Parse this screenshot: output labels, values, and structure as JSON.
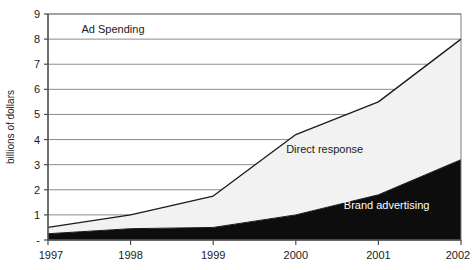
{
  "chart_data": {
    "type": "area",
    "title": "Ad Spending",
    "xlabel": "",
    "ylabel": "billions of dollars",
    "categories": [
      "1997",
      "1998",
      "1999",
      "2000",
      "2001",
      "2002"
    ],
    "x": [
      1997,
      1998,
      1999,
      2000,
      2001,
      2002
    ],
    "stacked": true,
    "grid": true,
    "legend_position": "inline-annotations",
    "ylim": [
      0,
      9
    ],
    "xlim": [
      1997,
      2002
    ],
    "ytick_labels": [
      "-",
      "1",
      "2",
      "3",
      "4",
      "5",
      "6",
      "7",
      "8",
      "9"
    ],
    "ytick_values": [
      0,
      1,
      2,
      3,
      4,
      5,
      6,
      7,
      8,
      9
    ],
    "xtick_labels": [
      "1997",
      "1998",
      "1999",
      "2000",
      "2001",
      "2002"
    ],
    "series": [
      {
        "name": "Brand advertising",
        "color": "#0d0d0d",
        "values": [
          0.25,
          0.45,
          0.5,
          1.0,
          1.8,
          3.2
        ]
      },
      {
        "name": "Direct response",
        "color": "#f2f2f2",
        "values": [
          0.25,
          0.55,
          1.25,
          3.2,
          3.7,
          4.8
        ]
      }
    ],
    "cumulative_totals": [
      0.5,
      1.0,
      1.75,
      4.2,
      5.5,
      8.0
    ],
    "annotations": [
      {
        "text": "Direct response",
        "x": 2000.35,
        "y": 3.45
      },
      {
        "text": "Brand advertising",
        "x": 2001.1,
        "y": 1.25
      }
    ]
  },
  "figure": {
    "background_color": "#ffffff",
    "frame_color": "#808080",
    "gridline_color": "#8c8c8c",
    "line_color": "#1a1a1a",
    "axis_color": "#4d4d4d"
  }
}
